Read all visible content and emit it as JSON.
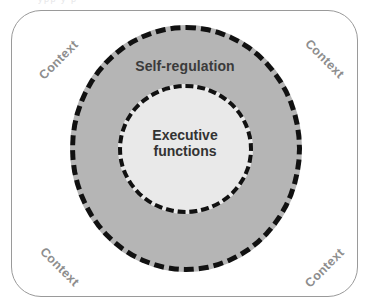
{
  "figure": {
    "type": "concentric-circles-diagram",
    "top_edge_artifact": "ypp   y       p",
    "frame": {
      "label_text": "Context",
      "corners": [
        {
          "position": "top-left",
          "label": "Context"
        },
        {
          "position": "top-right",
          "label": "Context"
        },
        {
          "position": "bottom-left",
          "label": "Context"
        },
        {
          "position": "bottom-right",
          "label": "Context"
        }
      ]
    },
    "rings": [
      {
        "name": "self-regulation",
        "label": "Self-regulation",
        "fill_color": "#b5b5b5",
        "border_color": "#111111",
        "border_style": "dashed"
      },
      {
        "name": "executive-functions",
        "label_line1": "Executive",
        "label_line2": "functions",
        "fill_color": "#e9e9e9",
        "border_color": "#111111",
        "border_style": "dashed"
      }
    ],
    "colors": {
      "background": "#ffffff",
      "frame_border": "#9a9a9a",
      "context_text": "#8d8d8d",
      "ring_text": "#3b3b3b",
      "core_text": "#333333"
    }
  }
}
